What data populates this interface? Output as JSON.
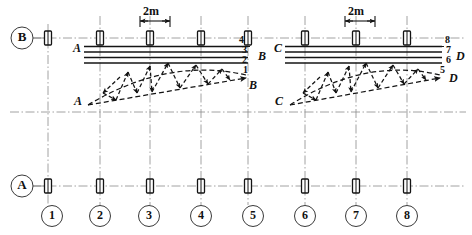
{
  "drawing": {
    "title": "Structural framing plan with two bowstring trusses",
    "units": "m",
    "ink_color": "#141414",
    "grid_color": "#7a7a7a",
    "paper_color": "#ffffff"
  },
  "dimensions": {
    "left_label": "2m",
    "right_label": "2m"
  },
  "axis_bubbles": {
    "horizontal_letters": [
      {
        "id": "B",
        "label": "B",
        "cx": 22,
        "cy": 38
      },
      {
        "id": "A",
        "label": "A",
        "cx": 22,
        "cy": 186
      }
    ],
    "vertical_numbers": [
      {
        "id": "1",
        "label": "1",
        "cx": 52,
        "cy": 216
      },
      {
        "id": "2",
        "label": "2",
        "cx": 100,
        "cy": 216
      },
      {
        "id": "3",
        "label": "3",
        "cx": 149,
        "cy": 216
      },
      {
        "id": "4",
        "label": "4",
        "cx": 201,
        "cy": 216
      },
      {
        "id": "5",
        "label": "5",
        "cx": 253,
        "cy": 216
      },
      {
        "id": "6",
        "label": "6",
        "cx": 305,
        "cy": 216
      },
      {
        "id": "7",
        "label": "7",
        "cx": 356,
        "cy": 216
      },
      {
        "id": "8",
        "label": "8",
        "cx": 407,
        "cy": 216
      }
    ]
  },
  "columns_row_b": [
    {
      "x": 48
    },
    {
      "x": 100
    },
    {
      "x": 150
    },
    {
      "x": 201
    },
    {
      "x": 248
    },
    {
      "x": 305
    },
    {
      "x": 356
    },
    {
      "x": 407
    }
  ],
  "columns_row_a": [
    {
      "x": 48
    },
    {
      "x": 100
    },
    {
      "x": 150
    },
    {
      "x": 201
    },
    {
      "x": 248
    },
    {
      "x": 305
    },
    {
      "x": 356
    },
    {
      "x": 407
    }
  ],
  "left_bay": {
    "beam_start_label": "A",
    "beam_end_label": "B",
    "truss_start_label": "A",
    "truss_end_label": "B",
    "purlin_numbers": [
      "4",
      "3",
      "2",
      "1"
    ]
  },
  "right_bay": {
    "beam_start_label": "C",
    "beam_end_label": "D",
    "truss_start_label": "C",
    "truss_end_label": "D",
    "purlin_numbers": [
      "8",
      "7",
      "6",
      "5"
    ]
  }
}
